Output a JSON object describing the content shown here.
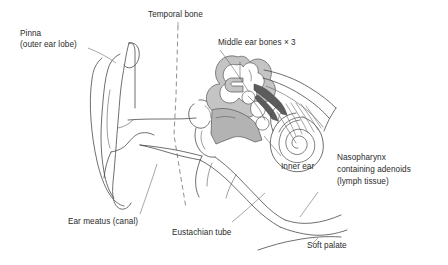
{
  "diagram": {
    "background_color": "#ffffff",
    "line_color": "#4a4a4a",
    "text_color": "#2b2b2b",
    "fill_light_gray": "#c4c4c4",
    "fill_mid_gray": "#b3b3b3",
    "fill_dark_gray": "#5c5c5c",
    "width": 448,
    "height": 265
  },
  "labels": {
    "pinna": {
      "line1": "Pinna",
      "line2": "(outer ear lobe)"
    },
    "temporal_bone": "Temporal bone",
    "middle_ear_bones": "Middle ear bones × 3",
    "inner_ear": "Inner ear",
    "nasopharynx": {
      "line1": "Nasopharynx",
      "line2": "containing adenoids",
      "line3": "(lymph tissue)"
    },
    "ear_meatus": "Ear meatus (canal)",
    "eustachian_tube": "Eustachian tube",
    "soft_palate": "Soft palate"
  }
}
